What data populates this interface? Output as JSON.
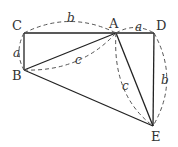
{
  "diagram": {
    "type": "geometry",
    "points": {
      "A": {
        "label": "A",
        "x": 116,
        "y": 33
      },
      "B": {
        "label": "B",
        "x": 24,
        "y": 70
      },
      "C": {
        "label": "C",
        "x": 24,
        "y": 33
      },
      "D": {
        "label": "D",
        "x": 154,
        "y": 33
      },
      "E": {
        "label": "E",
        "x": 153,
        "y": 126
      }
    },
    "segment_labels": {
      "CA": "b",
      "AD": "a",
      "CB": "a",
      "AB": "c",
      "AE": "c",
      "DE": "b"
    },
    "colors": {
      "line": "#222222",
      "dash": "#555555",
      "text": "#333333"
    }
  }
}
